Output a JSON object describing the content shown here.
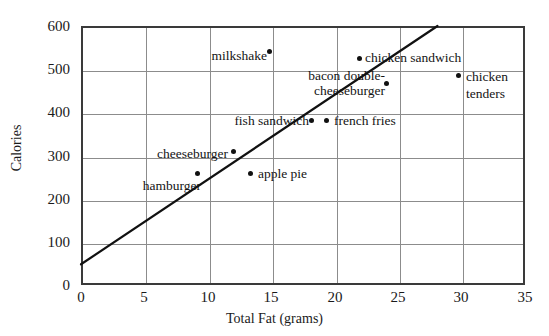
{
  "chart_data": {
    "type": "scatter",
    "title": "",
    "xlabel": "Total Fat (grams)",
    "ylabel": "Calories",
    "xlim": [
      0,
      35
    ],
    "ylim": [
      0,
      600
    ],
    "xticks": [
      0,
      5,
      10,
      15,
      20,
      25,
      30,
      35
    ],
    "yticks": [
      0,
      100,
      200,
      300,
      400,
      500,
      600
    ],
    "grid": true,
    "legend": "none",
    "points": [
      {
        "label": "hamburger",
        "x": 9.0,
        "y": 262,
        "label_pos": "below-left"
      },
      {
        "label": "cheeseburger",
        "x": 11.9,
        "y": 315,
        "label_pos": "left"
      },
      {
        "label": "apple pie",
        "x": 13.2,
        "y": 264,
        "label_pos": "right"
      },
      {
        "label": "milkshake",
        "x": 14.7,
        "y": 545,
        "label_pos": "left"
      },
      {
        "label": "fish sandwich",
        "x": 18.0,
        "y": 385,
        "label_pos": "left"
      },
      {
        "label": "french fries",
        "x": 19.2,
        "y": 385,
        "label_pos": "right"
      },
      {
        "label": "chicken sandwich",
        "x": 21.8,
        "y": 530,
        "label_pos": "right"
      },
      {
        "label": "bacon double-cheeseburger",
        "x": 23.9,
        "y": 472,
        "label_pos": "left-twoline"
      },
      {
        "label": "chicken tenders",
        "x": 29.6,
        "y": 489,
        "label_pos": "right-twoline"
      }
    ],
    "trendline": {
      "label": "line of best fit",
      "x_start": 0,
      "y_start": 48,
      "x_end": 28.1,
      "y_end": 600
    },
    "colors": {
      "point": "#111111",
      "trendline": "#111111",
      "grid": "#8c8c8c",
      "frame": "#3a3a3a",
      "background": "#ffffff",
      "text": "#1a1a1a"
    }
  },
  "labels": {
    "p0": "hamburger",
    "p1": "cheeseburger",
    "p2": "apple pie",
    "p3": "milkshake",
    "p4": "fish sandwich",
    "p5": "french fries",
    "p6": "chicken sandwich",
    "p7a": "bacon double-",
    "p7b": "cheeseburger",
    "p8": "chicken tenders"
  },
  "axes": {
    "x_title": "Total Fat (grams)",
    "y_title": "Calories",
    "x_tick_labels": [
      "0",
      "5",
      "10",
      "15",
      "20",
      "25",
      "30",
      "35"
    ],
    "y_tick_labels": [
      "0",
      "100",
      "200",
      "300",
      "400",
      "500",
      "600"
    ]
  }
}
